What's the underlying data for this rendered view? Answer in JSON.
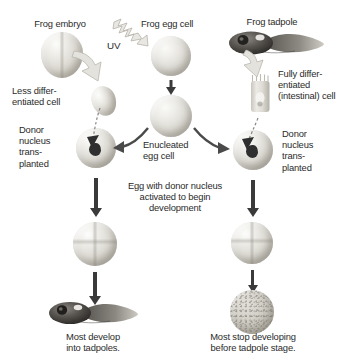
{
  "figure": {
    "background_color": "#ffffff"
  },
  "labels": {
    "frog_embryo": "Frog embryo",
    "uv": "UV",
    "frog_egg_cell": "Frog egg cell",
    "frog_tadpole": "Frog tadpole",
    "less_differentiated_cell": "Less differ-\nentiated cell",
    "fully_differentiated_cell": "Fully differ-\nentiated\n(intestinal) cell",
    "donor_nucleus_transplanted_left": "Donor\nnucleus\ntrans-\nplanted",
    "donor_nucleus_transplanted_right": "Donor\nnucleus\ntrans-\nplanted",
    "enucleated_egg_cell": "Enucleated\negg cell",
    "egg_activated": "Egg with donor nucleus\nactivated to begin\ndevelopment",
    "most_develop": "Most develop\ninto tadpoles.",
    "most_stop": "Most stop developing\nbefore tadpole stage."
  },
  "icons": {
    "uv_bolt": "uv-lightning-bolt-icon",
    "fat_arrow_left": "thick-curved-arrow-icon",
    "fat_arrow_right": "thick-curved-arrow-icon",
    "down_arrow": "down-arrow-icon",
    "branch_arrow_left": "curved-branch-arrow-icon",
    "branch_arrow_right": "curved-branch-arrow-icon",
    "dashed_transfer_left": "dashed-nucleus-transfer-arrow-icon",
    "dashed_transfer_right": "dashed-nucleus-transfer-arrow-icon"
  },
  "specimens": {
    "frog_embryo": "frog-embryo-illustration",
    "frog_egg_cell": "frog-egg-cell-illustration",
    "frog_tadpole_top": "frog-tadpole-illustration",
    "less_differentiated_cell": "less-differentiated-cell-illustration",
    "intestinal_cell": "intestinal-columnar-cell-illustration",
    "enucleated_egg": "enucleated-egg-cell-illustration",
    "recipient_egg_left": "recipient-egg-with-donor-nucleus-illustration",
    "recipient_egg_right": "recipient-egg-with-donor-nucleus-illustration",
    "cleaving_embryo_left": "cleaving-embryo-illustration",
    "cleaving_embryo_right": "cleaving-embryo-illustration",
    "tadpole_outcome": "developed-tadpole-illustration",
    "arrested_blastula": "arrested-blastula-illustration"
  },
  "colors": {
    "text": "#2b2b2b",
    "thin_arrow": "#3a3a3a",
    "fat_arrow_fill": "#e3e2dd",
    "fat_arrow_stroke": "#b9b6ad",
    "dashed_arrow": "#8a8780",
    "cell_light": "#f2f1ed",
    "cell_mid": "#d8d5ce",
    "cell_dark": "#a8a49a",
    "nucleus": "#2f2f2f"
  }
}
